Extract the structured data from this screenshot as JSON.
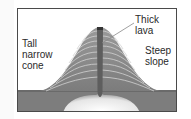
{
  "diagram": {
    "labels": {
      "tall_narrow_cone": "Tall\nnarrow\ncone",
      "thick_lava": "Thick\nlava",
      "steep_slope": "Steep\nslope"
    },
    "colors": {
      "cone_fill": "#8e8e8e",
      "cone_layer_lines": "#d6d6d6",
      "vent": "#5a5a5a",
      "ground": "#7a7a7a",
      "magma_chamber": "#eeeeee",
      "frame_border": "#4a4a4a",
      "text": "#2a2a2a"
    }
  }
}
